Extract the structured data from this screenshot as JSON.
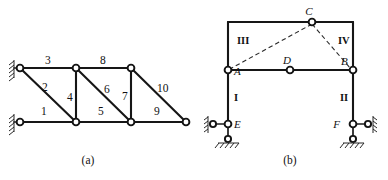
{
  "figure": {
    "background_color": "#ffffff",
    "line_color": "#141414",
    "dashed_color": "#2a2a2a",
    "panels": [
      {
        "id": "panel-a",
        "caption": "(a)",
        "type": "planar-truss",
        "description": "Truss with ten numbered members supported by two wall supports on the left",
        "member_numbers": [
          "1",
          "2",
          "3",
          "4",
          "5",
          "6",
          "7",
          "8",
          "9",
          "10"
        ],
        "labels": {
          "m1": "1",
          "m2": "2",
          "m3": "3",
          "m4": "4",
          "m5": "5",
          "m6": "6",
          "m7": "7",
          "m8": "8",
          "m9": "9",
          "m10": "10"
        }
      },
      {
        "id": "panel-b",
        "caption": "(b)",
        "type": "rigid-frame",
        "description": "Portal frame with rigid bodies I, II, III, IV, joints A, B, C, D and supports E, F",
        "joint_labels": [
          "A",
          "B",
          "C",
          "D",
          "E",
          "F"
        ],
        "body_labels": [
          "I",
          "II",
          "III",
          "IV"
        ],
        "labels": {
          "A": "A",
          "B": "B",
          "C": "C",
          "D": "D",
          "E": "E",
          "F": "F",
          "I": "I",
          "II": "II",
          "III": "III",
          "IV": "IV"
        }
      }
    ]
  }
}
